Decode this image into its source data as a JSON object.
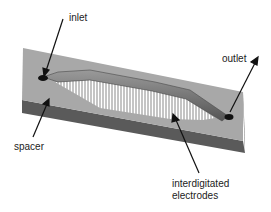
{
  "diagram": {
    "type": "microfluidic-device-3d-schematic",
    "labels": {
      "inlet": "inlet",
      "outlet": "outlet",
      "spacer": "spacer",
      "electrodes_line1": "interdigitated",
      "electrodes_line2": "electrodes"
    },
    "colors": {
      "slab_top": "#a8a8a8",
      "slab_front": "#5a5a5a",
      "slab_side": "#7a7a7a",
      "channel": "#6e6e6e",
      "electrode_bg": "#ffffff",
      "electrode_lines": "#888888",
      "port": "#111111",
      "arrow": "#111111"
    }
  }
}
